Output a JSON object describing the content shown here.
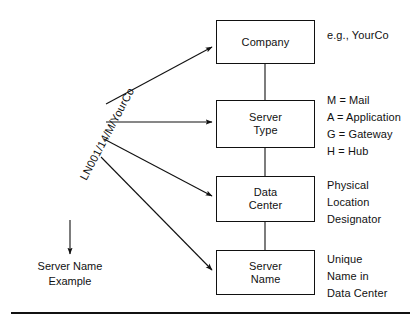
{
  "diagram": {
    "type": "hierarchy-naming-convention",
    "sample_code": "LN001/14/M/YourCo",
    "nodes": [
      {
        "id": "company",
        "label": "Company",
        "note": "e.g., YourCo"
      },
      {
        "id": "server-type",
        "label": "Server\nType",
        "note": "M = Mail\nA = Application\nG = Gateway\nH = Hub"
      },
      {
        "id": "data-center",
        "label": "Data\nCenter",
        "note": "Physical\nLocation\nDesignator"
      },
      {
        "id": "server-name",
        "label": "Server\nName",
        "note": "Unique\nName in\nData Center"
      }
    ],
    "example_caption": "Server Name\nExample",
    "colors": {
      "stroke": "#111111",
      "text": "#111111",
      "background": "#ffffff"
    }
  }
}
